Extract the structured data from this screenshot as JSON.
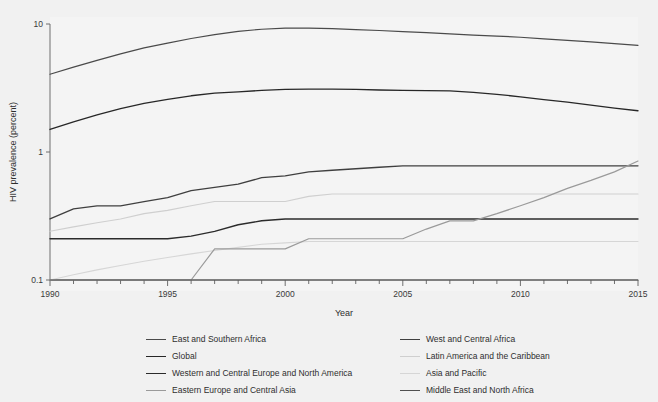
{
  "figure": {
    "caption_number": "",
    "caption_text": "",
    "background_color": "#f1f1f1",
    "plot_background_color": "#f4f4f4"
  },
  "chart_data": {
    "type": "line",
    "title": "",
    "xlabel": "Year",
    "ylabel": "HIV prevalence (percent)",
    "yscale": "log",
    "ylim": [
      0.1,
      10
    ],
    "ytick_labels": [
      "0.1",
      "1",
      "10"
    ],
    "ytick_values": [
      0.1,
      1,
      10
    ],
    "xlim": [
      1990,
      2015
    ],
    "xtick_labels": [
      "1990",
      "1995",
      "2000",
      "2005",
      "2010",
      "2015"
    ],
    "xtick_values": [
      1990,
      1995,
      2000,
      2005,
      2010,
      2015
    ],
    "minor_xticks_every": 1,
    "grid": false,
    "legend_position": "bottom",
    "x": [
      1990,
      1991,
      1992,
      1993,
      1994,
      1995,
      1996,
      1997,
      1998,
      1999,
      2000,
      2001,
      2002,
      2003,
      2004,
      2005,
      2006,
      2007,
      2008,
      2009,
      2010,
      2011,
      2012,
      2013,
      2014,
      2015
    ],
    "series": [
      {
        "name": "East and Southern Africa",
        "color": "#4a4a4a",
        "width": 1.2,
        "values": [
          4.05,
          4.6,
          5.2,
          5.85,
          6.5,
          7.1,
          7.7,
          8.25,
          8.75,
          9.1,
          9.28,
          9.3,
          9.2,
          9.05,
          8.9,
          8.72,
          8.55,
          8.38,
          8.2,
          8.05,
          7.88,
          7.65,
          7.45,
          7.25,
          7.02,
          6.82
        ]
      },
      {
        "name": "West and Central Africa",
        "color": "#3f3f3f",
        "width": 1.3,
        "values": [
          0.3,
          0.36,
          0.38,
          0.38,
          0.41,
          0.44,
          0.5,
          0.53,
          0.56,
          0.63,
          0.65,
          0.7,
          0.72,
          0.74,
          0.76,
          0.78,
          0.78,
          0.78,
          0.78,
          0.78,
          0.78,
          0.78,
          0.78,
          0.78,
          0.78,
          0.78
        ]
      },
      {
        "name": "Global",
        "color": "#272727",
        "width": 1.3,
        "values": [
          1.5,
          1.72,
          1.95,
          2.18,
          2.4,
          2.58,
          2.75,
          2.88,
          2.95,
          3.03,
          3.08,
          3.1,
          3.1,
          3.08,
          3.05,
          3.03,
          3.02,
          3.0,
          2.92,
          2.82,
          2.7,
          2.57,
          2.45,
          2.32,
          2.2,
          2.1
        ]
      },
      {
        "name": "Latin America and the Caribbean",
        "color": "#cfcfcf",
        "width": 1.1,
        "values": [
          0.24,
          0.26,
          0.28,
          0.3,
          0.33,
          0.35,
          0.38,
          0.41,
          0.41,
          0.41,
          0.41,
          0.45,
          0.47,
          0.47,
          0.47,
          0.47,
          0.47,
          0.47,
          0.47,
          0.47,
          0.47,
          0.47,
          0.47,
          0.47,
          0.47,
          0.47
        ]
      },
      {
        "name": "Western and Central Europe and North America",
        "color": "#2b2b2b",
        "width": 1.4,
        "values": [
          0.21,
          0.21,
          0.21,
          0.21,
          0.21,
          0.21,
          0.22,
          0.24,
          0.27,
          0.29,
          0.3,
          0.3,
          0.3,
          0.3,
          0.3,
          0.3,
          0.3,
          0.3,
          0.3,
          0.3,
          0.3,
          0.3,
          0.3,
          0.3,
          0.3,
          0.3
        ]
      },
      {
        "name": "Asia and Pacific",
        "color": "#d6d6d6",
        "width": 1.1,
        "values": [
          0.1,
          0.11,
          0.12,
          0.13,
          0.14,
          0.15,
          0.16,
          0.17,
          0.18,
          0.19,
          0.195,
          0.2,
          0.2,
          0.2,
          0.2,
          0.2,
          0.2,
          0.2,
          0.2,
          0.2,
          0.2,
          0.2,
          0.2,
          0.2,
          0.2,
          0.2
        ]
      },
      {
        "name": "Eastern Europe and Central Asia",
        "color": "#9a9a9a",
        "width": 1.2,
        "values": [
          0.1,
          0.1,
          0.1,
          0.1,
          0.1,
          0.1,
          0.1,
          0.175,
          0.175,
          0.175,
          0.175,
          0.21,
          0.21,
          0.21,
          0.21,
          0.21,
          0.25,
          0.29,
          0.29,
          0.33,
          0.38,
          0.44,
          0.52,
          0.6,
          0.7,
          0.85
        ]
      },
      {
        "name": "Middle East and North Africa",
        "color": "#4f4f4f",
        "width": 1.2,
        "values": [
          0.1,
          0.1,
          0.1,
          0.1,
          0.1,
          0.1,
          0.1,
          0.1,
          0.1,
          0.1,
          0.1,
          0.1,
          0.1,
          0.1,
          0.1,
          0.1,
          0.1,
          0.1,
          0.1,
          0.1,
          0.1,
          0.1,
          0.1,
          0.1,
          0.1,
          0.1
        ]
      }
    ]
  },
  "legend": {
    "columns": [
      {
        "items": [
          {
            "label": "East and Southern Africa",
            "color": "#4a4a4a",
            "width": 1.2
          },
          {
            "label": "Global",
            "color": "#272727",
            "width": 1.6
          },
          {
            "label": "Western and Central Europe and North America",
            "color": "#2b2b2b",
            "width": 1.6
          },
          {
            "label": "Eastern Europe and Central Asia",
            "color": "#9a9a9a",
            "width": 1.3
          }
        ]
      },
      {
        "items": [
          {
            "label": "West and Central Africa",
            "color": "#3f3f3f",
            "width": 1.4
          },
          {
            "label": "Latin America and the Caribbean",
            "color": "#cfcfcf",
            "width": 1.1
          },
          {
            "label": "Asia and Pacific",
            "color": "#d6d6d6",
            "width": 1.1
          },
          {
            "label": "Middle East and North Africa",
            "color": "#4f4f4f",
            "width": 1.3
          }
        ]
      }
    ]
  },
  "axis_style": {
    "axis_color": "#6f6f6f",
    "tick_label_color": "#3a3a3a",
    "axis_title_color": "#2e2e2e"
  }
}
